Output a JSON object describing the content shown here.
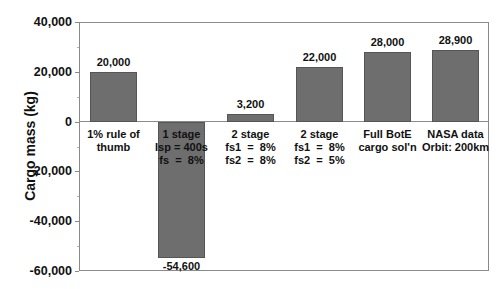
{
  "chart_data": {
    "type": "bar",
    "title": "",
    "xlabel": "",
    "ylabel": "Cargo mass (kg)",
    "ylim": [
      -60000,
      40000
    ],
    "yticks": [
      40000,
      20000,
      0,
      -20000,
      -40000,
      -60000
    ],
    "ytick_labels": [
      "40,000",
      "20,000",
      "0",
      "-20,000",
      "-40,000",
      "-60,000"
    ],
    "grid": false,
    "legend": null,
    "categories": [
      "1% rule of\nthumb",
      "1 stage\nIsp = 400s\nfs  =  8%",
      "2 stage\nfs1  =  8%\nfs2  =  8%",
      "2 stage\nfs1  =  8%\nfs2  =  5%",
      "Full BotE\ncargo sol'n",
      "NASA data\nOrbit: 200km"
    ],
    "values": [
      20000,
      -54600,
      3200,
      22000,
      28000,
      28900
    ],
    "value_labels": [
      "20,000",
      "-54,600",
      "3,200",
      "22,000",
      "28,000",
      "28,900"
    ],
    "bar_color": "#6e6e6e"
  }
}
